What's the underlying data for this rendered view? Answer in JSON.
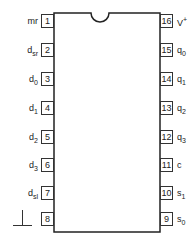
{
  "diagram": {
    "type": "ic-pinout",
    "package": "DIP-16",
    "pins_left": [
      {
        "num": "1",
        "label": "mr",
        "sub": ""
      },
      {
        "num": "2",
        "label": "d",
        "sub": "sr"
      },
      {
        "num": "3",
        "label": "d",
        "sub": "0"
      },
      {
        "num": "4",
        "label": "d",
        "sub": "1"
      },
      {
        "num": "5",
        "label": "d",
        "sub": "2"
      },
      {
        "num": "6",
        "label": "d",
        "sub": "3"
      },
      {
        "num": "7",
        "label": "d",
        "sub": "sl"
      },
      {
        "num": "8",
        "label": "",
        "sub": "",
        "symbol": "ground"
      }
    ],
    "pins_right": [
      {
        "num": "16",
        "label": "V",
        "sup": "+"
      },
      {
        "num": "15",
        "label": "q",
        "sub": "0"
      },
      {
        "num": "14",
        "label": "q",
        "sub": "1"
      },
      {
        "num": "13",
        "label": "q",
        "sub": "2"
      },
      {
        "num": "12",
        "label": "q",
        "sub": "3"
      },
      {
        "num": "11",
        "label": "c",
        "sub": ""
      },
      {
        "num": "10",
        "label": "s",
        "sub": "1"
      },
      {
        "num": "9",
        "label": "s",
        "sub": "0"
      }
    ]
  }
}
